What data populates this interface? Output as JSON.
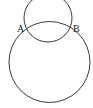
{
  "diagram": {
    "type": "geometry",
    "stroke_color": "#3a3a3a",
    "background": "#ffffff",
    "circles": [
      {
        "name": "small-circle",
        "cx": 48,
        "cy": 18,
        "r": 24
      },
      {
        "name": "large-circle",
        "cx": 49.5,
        "cy": 62,
        "r": 40.5
      }
    ],
    "points": [
      {
        "label": "A",
        "x": 17,
        "y": 32
      },
      {
        "label": "B",
        "x": 73,
        "y": 32
      }
    ]
  }
}
